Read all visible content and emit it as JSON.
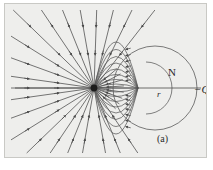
{
  "figure": {
    "caption": "(a)",
    "panel_background": "#eeeeec",
    "panel_border": "#c9c9c5",
    "line_color": "#4a4a4a",
    "labels": {
      "sphere": "N",
      "radius": "r",
      "charge": "−Q"
    }
  },
  "chart_data": {
    "type": "scatter",
    "xlabel": "",
    "ylabel": "",
    "xlim": [
      0,
      203
    ],
    "ylim": [
      0,
      155
    ],
    "grid": false,
    "legend": "none",
    "annotations": [
      {
        "text": "N",
        "x": 168,
        "y": 68,
        "role": "sphere-label"
      },
      {
        "text": "r",
        "x": 156,
        "y": 90,
        "role": "radius-label"
      },
      {
        "text": "−Q",
        "x": 193,
        "y": 85,
        "role": "charge-label"
      },
      {
        "text": "(a)",
        "x": 157,
        "y": 135,
        "role": "figure-caption"
      }
    ],
    "series": [
      {
        "name": "point-charge",
        "type": "point",
        "x": [
          89
        ],
        "y": [
          84
        ],
        "note": "negative point charge -Q, field lines converge inward"
      },
      {
        "name": "image-charge-focus",
        "type": "point",
        "x": [
          133
        ],
        "y": [
          84
        ],
        "note": "secondary convergence point inside sphere"
      },
      {
        "name": "sphere-N",
        "type": "circle",
        "cx": 150,
        "cy": 84,
        "r": 42,
        "note": "grounded conducting sphere boundary"
      },
      {
        "name": "inner-arc",
        "type": "circle",
        "cx": 141,
        "cy": 84,
        "r": 26,
        "note": "inner equipotential-like arc"
      },
      {
        "name": "axis",
        "type": "line",
        "x": [
          10,
          196
        ],
        "y": [
          84,
          84
        ],
        "note": "horizontal symmetry axis through charge and sphere center"
      },
      {
        "name": "radius-segment",
        "type": "line",
        "x": [
          150,
          192
        ],
        "y": [
          84,
          84
        ],
        "note": "radius r of sphere N"
      },
      {
        "name": "radial-field-lines",
        "type": "rays",
        "count": 30,
        "origin_x": 89,
        "origin_y": 84,
        "arrow_direction": "inward",
        "angles_deg": [
          100,
          112,
          124,
          136,
          148,
          160,
          172,
          180,
          188,
          200,
          212,
          224,
          236,
          248,
          260,
          272,
          284,
          296,
          308,
          320,
          332,
          344,
          356,
          8,
          20,
          32,
          44,
          56,
          68,
          80
        ],
        "note": "straight radial lines with arrowheads pointing toward the charge"
      },
      {
        "name": "curved-field-lines",
        "type": "curves",
        "count": 9,
        "from_x": 89,
        "from_y": 84,
        "to_x": 133,
        "to_y": 84,
        "note": "field lines bending from charge to the induced surface of the sphere"
      }
    ]
  }
}
